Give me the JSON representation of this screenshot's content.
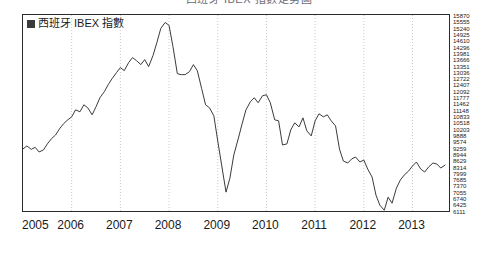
{
  "chart_data": {
    "type": "line",
    "title": "西班牙 IBEX 指數走勢圖",
    "xlabel": "",
    "ylabel": "",
    "legend": [
      {
        "label": "西班牙 IBEX 指數",
        "color": "#3b3b3b",
        "marker": "filled-square"
      }
    ],
    "legend_position": "top-left",
    "grid": "vertical-dotted-yearly",
    "xlim": [
      2005.0,
      2013.75
    ],
    "ylim": [
      6111,
      15870
    ],
    "xticks": [
      "2005",
      "2006",
      "2007",
      "2008",
      "2009",
      "2010",
      "2011",
      "2012",
      "2013"
    ],
    "yticks": [
      "15870",
      "15555",
      "15240",
      "14925",
      "14610",
      "14296",
      "13981",
      "13666",
      "13351",
      "13036",
      "12722",
      "12407",
      "12092",
      "11777",
      "11462",
      "11148",
      "10833",
      "10518",
      "10203",
      "9888",
      "9574",
      "9259",
      "8944",
      "8629",
      "8314",
      "7999",
      "7685",
      "7370",
      "7055",
      "6740",
      "6425",
      "6111"
    ],
    "series": [
      {
        "name": "西班牙 IBEX 指數",
        "color": "#3b3b3b",
        "x": [
          2005.0,
          2005.08,
          2005.17,
          2005.25,
          2005.33,
          2005.42,
          2005.5,
          2005.58,
          2005.67,
          2005.75,
          2005.83,
          2005.92,
          2006.0,
          2006.08,
          2006.17,
          2006.25,
          2006.33,
          2006.42,
          2006.5,
          2006.58,
          2006.67,
          2006.75,
          2006.83,
          2006.92,
          2007.0,
          2007.08,
          2007.17,
          2007.25,
          2007.33,
          2007.42,
          2007.5,
          2007.58,
          2007.67,
          2007.75,
          2007.83,
          2007.92,
          2008.0,
          2008.08,
          2008.17,
          2008.25,
          2008.33,
          2008.42,
          2008.5,
          2008.58,
          2008.67,
          2008.75,
          2008.83,
          2008.92,
          2009.0,
          2009.08,
          2009.17,
          2009.25,
          2009.33,
          2009.42,
          2009.5,
          2009.58,
          2009.67,
          2009.75,
          2009.83,
          2009.92,
          2010.0,
          2010.08,
          2010.17,
          2010.25,
          2010.33,
          2010.42,
          2010.5,
          2010.58,
          2010.67,
          2010.75,
          2010.83,
          2010.92,
          2011.0,
          2011.08,
          2011.17,
          2011.25,
          2011.33,
          2011.42,
          2011.5,
          2011.58,
          2011.67,
          2011.75,
          2011.83,
          2011.92,
          2012.0,
          2012.08,
          2012.17,
          2012.25,
          2012.33,
          2012.42,
          2012.5,
          2012.58,
          2012.67,
          2012.75,
          2012.83,
          2012.92,
          2013.0,
          2013.08,
          2013.17,
          2013.25,
          2013.33,
          2013.42,
          2013.5,
          2013.58,
          2013.67
        ],
        "values": [
          9200,
          9350,
          9180,
          9280,
          9050,
          9150,
          9450,
          9700,
          9900,
          10200,
          10450,
          10650,
          10800,
          11150,
          11050,
          11400,
          11250,
          10900,
          11300,
          11750,
          12050,
          12400,
          12700,
          13000,
          13250,
          13100,
          13500,
          13750,
          13600,
          13400,
          13650,
          13300,
          13850,
          14500,
          15200,
          15500,
          15350,
          14300,
          12950,
          12900,
          12900,
          13050,
          13400,
          13100,
          12200,
          11400,
          11250,
          10850,
          9600,
          8400,
          7050,
          7750,
          8900,
          9700,
          10450,
          11150,
          11550,
          11750,
          11500,
          11850,
          11900,
          11500,
          10650,
          10600,
          9400,
          9450,
          10150,
          10500,
          10300,
          10750,
          10100,
          9850,
          10600,
          10950,
          10800,
          10900,
          10600,
          10350,
          9200,
          8600,
          8500,
          8700,
          8800,
          8550,
          8650,
          8200,
          7800,
          6900,
          6400,
          6150,
          6800,
          6500,
          7250,
          7650,
          7900,
          8100,
          8350,
          8550,
          8200,
          8050,
          8300,
          8500,
          8450,
          8250,
          8400
        ]
      }
    ]
  }
}
